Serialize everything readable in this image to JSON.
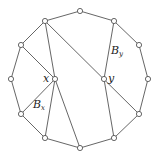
{
  "diagram": {
    "vertices": [
      {
        "id": "v0",
        "x": 80,
        "y": 11
      },
      {
        "id": "v1",
        "x": 114,
        "y": 21
      },
      {
        "id": "v2",
        "x": 139,
        "y": 45
      },
      {
        "id": "v3",
        "x": 148,
        "y": 79
      },
      {
        "id": "v4",
        "x": 139,
        "y": 114
      },
      {
        "id": "v5",
        "x": 114,
        "y": 138
      },
      {
        "id": "v6",
        "x": 80,
        "y": 148
      },
      {
        "id": "v7",
        "x": 45,
        "y": 138
      },
      {
        "id": "v8",
        "x": 21,
        "y": 114
      },
      {
        "id": "v9",
        "x": 11,
        "y": 79
      },
      {
        "id": "v10",
        "x": 21,
        "y": 45
      },
      {
        "id": "v11",
        "x": 45,
        "y": 21
      },
      {
        "id": "x",
        "x": 55,
        "y": 79
      },
      {
        "id": "y",
        "x": 104,
        "y": 79
      }
    ],
    "labels": {
      "x": "x",
      "y": "y",
      "Bx_main": "B",
      "Bx_sub": "x",
      "By_main": "B",
      "By_sub": "y"
    }
  }
}
